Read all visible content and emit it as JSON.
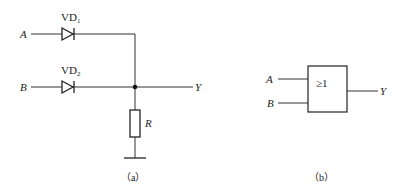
{
  "figure_a": {
    "caption": "（a）",
    "inputs": [
      {
        "label": "A",
        "diode_label": "VD",
        "diode_sub": "1"
      },
      {
        "label": "B",
        "diode_label": "VD",
        "diode_sub": "2"
      }
    ],
    "output_label": "Y",
    "resistor_label": "R"
  },
  "figure_b": {
    "caption": "（b）",
    "gate_symbol": "≥1",
    "inputs": [
      {
        "label": "A"
      },
      {
        "label": "B"
      }
    ],
    "output_label": "Y"
  }
}
